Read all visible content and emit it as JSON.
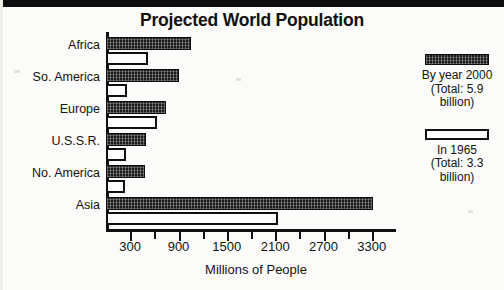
{
  "figure": {
    "title": "Projected World Population"
  },
  "chart_data": {
    "type": "bar",
    "orientation": "horizontal",
    "title": "Projected World Population",
    "xlabel": "Millions of People",
    "ylabel": "",
    "xlim": [
      0,
      3600
    ],
    "grid": false,
    "legend_position": "right",
    "categories": [
      "Africa",
      "So. America",
      "Europe",
      "U.S.S.R.",
      "No. America",
      "Asia"
    ],
    "tick_labels": [
      "300",
      "900",
      "1500",
      "2100",
      "2700",
      "3300"
    ],
    "tick_values": [
      300,
      900,
      1500,
      2100,
      2700,
      3300
    ],
    "minor_tick_values": [
      600,
      1200,
      1800,
      2400,
      3000
    ],
    "series": [
      {
        "name": "By year 2000",
        "legend_label": "By year 2000",
        "legend_total_line1": "(Total: 5.9",
        "legend_total_line2": "billion)",
        "swatch": "dark",
        "values": [
          1050,
          900,
          750,
          500,
          490,
          3310
        ]
      },
      {
        "name": "In 1965",
        "legend_label": "In 1965",
        "legend_total_line1": "(Total: 3.3",
        "legend_total_line2": "billion)",
        "swatch": "light",
        "values": [
          520,
          265,
          630,
          250,
          240,
          2130
        ]
      }
    ]
  },
  "colors": {
    "dark_bar": "#1c1c1c",
    "light_bar": "#fdfdfb",
    "outline": "#101010",
    "text": "#141414",
    "background": "#fbfbf9"
  }
}
